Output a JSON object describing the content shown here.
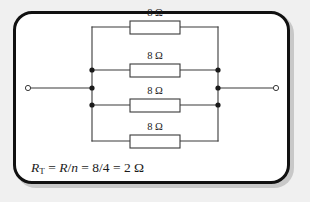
{
  "figure": {
    "type": "parallel-resistor-circuit",
    "border_color": "#111111",
    "panel_background": "#ffffff",
    "page_background": "#f0f0f0",
    "wire_color": "#3a3a3a"
  },
  "branches": [
    {
      "id": "branch-1",
      "label": "8 Ω",
      "resistance": 8,
      "unit": "Ω"
    },
    {
      "id": "branch-2",
      "label": "8 Ω",
      "resistance": 8,
      "unit": "Ω"
    },
    {
      "id": "branch-3",
      "label": "8 Ω",
      "resistance": 8,
      "unit": "Ω"
    },
    {
      "id": "branch-4",
      "label": "8 Ω",
      "resistance": 8,
      "unit": "Ω"
    }
  ],
  "formula": {
    "lhs_symbol": "R",
    "lhs_subscript": "T",
    "eq1": " = ",
    "expr_ratio": "R",
    "slash": "/",
    "expr_n": "n",
    "eq2": " = ",
    "numbers": "8/4",
    "eq3": " = ",
    "result": "2 Ω",
    "full_text": "RT = R/n = 8/4 = 2 Ω"
  },
  "terminals": {
    "left_label": "left-terminal",
    "right_label": "right-terminal"
  }
}
